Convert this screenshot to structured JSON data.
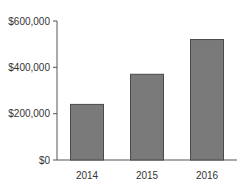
{
  "chart_data": {
    "type": "bar",
    "title": "",
    "xlabel": "",
    "ylabel": "",
    "categories": [
      "2014",
      "2015",
      "2016"
    ],
    "values": [
      240000,
      370000,
      520000
    ],
    "ylim": [
      0,
      600000
    ],
    "yticks": [
      0,
      200000,
      400000,
      600000
    ],
    "ytick_labels": [
      "$0",
      "$200,000",
      "$400,000",
      "$600,000"
    ],
    "grid": false,
    "legend": null,
    "bar_color": "#7a7a7a",
    "bar_edge_color": "#4a4a4a",
    "axis_color": "#555555"
  }
}
